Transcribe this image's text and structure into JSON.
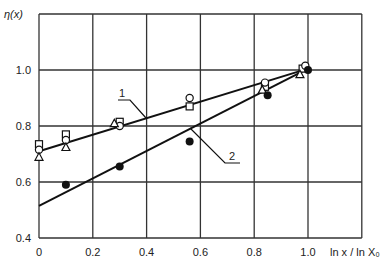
{
  "chart_data": {
    "type": "scatter",
    "title": "",
    "xlabel": "ln x / ln X₀",
    "ylabel": "η(x)",
    "xlim": [
      0,
      1.2
    ],
    "ylim": [
      0.4,
      1.2
    ],
    "x_ticks": [
      "0",
      "0.2",
      "0.4",
      "0.6",
      "0.8",
      "1.0"
    ],
    "y_ticks": [
      "0.4",
      "0.6",
      "0.8",
      "1.0"
    ],
    "grid": true,
    "series": [
      {
        "name": "square",
        "marker": "open-square",
        "points": [
          [
            0.0,
            0.735
          ],
          [
            0.1,
            0.77
          ],
          [
            0.3,
            0.815
          ],
          [
            0.56,
            0.87
          ],
          [
            0.84,
            0.94
          ],
          [
            0.98,
            1.005
          ]
        ]
      },
      {
        "name": "circle",
        "marker": "open-circle",
        "points": [
          [
            0.0,
            0.715
          ],
          [
            0.1,
            0.75
          ],
          [
            0.3,
            0.8
          ],
          [
            0.56,
            0.9
          ],
          [
            0.84,
            0.955
          ],
          [
            0.99,
            1.015
          ]
        ]
      },
      {
        "name": "triangle",
        "marker": "open-triangle",
        "points": [
          [
            0.0,
            0.69
          ],
          [
            0.1,
            0.725
          ],
          [
            0.28,
            0.81
          ],
          [
            0.83,
            0.93
          ],
          [
            0.97,
            0.985
          ]
        ]
      },
      {
        "name": "filled",
        "marker": "filled-circle",
        "points": [
          [
            0.1,
            0.59
          ],
          [
            0.3,
            0.655
          ],
          [
            0.56,
            0.745
          ],
          [
            0.85,
            0.91
          ],
          [
            1.0,
            1.0
          ]
        ]
      }
    ],
    "lines": [
      {
        "label": "1",
        "from": [
          0.0,
          0.71
        ],
        "to": [
          1.0,
          1.005
        ]
      },
      {
        "label": "2",
        "from": [
          0.0,
          0.515
        ],
        "to": [
          1.0,
          1.005
        ]
      }
    ]
  }
}
